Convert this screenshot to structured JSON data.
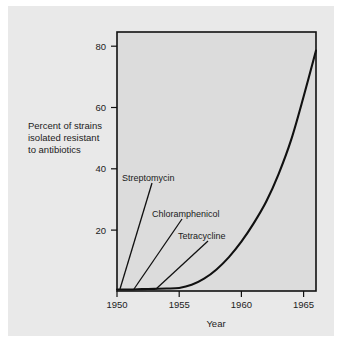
{
  "chart_data": {
    "type": "line",
    "title": "",
    "subtitle": "",
    "xlabel": "Year",
    "ylabel": "Percent of strains isolated resistant to antibiotics",
    "ylabel_lines": [
      "Percent of strains",
      "isolated resistant",
      "to antibiotics"
    ],
    "xlim": [
      1950,
      1966
    ],
    "ylim": [
      0,
      84
    ],
    "xticks": [
      1950,
      1955,
      1960,
      1965
    ],
    "xtick_labels": [
      "1950",
      "1955",
      "1960",
      "1965"
    ],
    "yticks": [
      20,
      40,
      60,
      80
    ],
    "ytick_labels": [
      "20",
      "40",
      "60",
      "80"
    ],
    "grid": false,
    "legend": "none",
    "series": [
      {
        "name": "Percent of strains isolated resistant to antibiotics",
        "x": [
          1950,
          1951,
          1952,
          1953,
          1954,
          1955,
          1956,
          1957,
          1958,
          1959,
          1960,
          1961,
          1962,
          1963,
          1964,
          1965,
          1966
        ],
        "values": [
          0.5,
          0.5,
          0.6,
          0.7,
          0.8,
          1.0,
          2.0,
          4.0,
          7.0,
          11.0,
          16.0,
          22.0,
          29.0,
          38.0,
          49.0,
          63.0,
          78.0
        ]
      }
    ],
    "annotations": [
      {
        "label": "Streptomycin",
        "text_x": 1951.3,
        "text_y": 33.0
      },
      {
        "label": "Chloramphenicol",
        "text_x": 1954.0,
        "text_y": 23.5
      },
      {
        "label": "Tetracycline",
        "text_x": 1956.5,
        "text_y": 16.0
      }
    ],
    "colors": {
      "figure_background": "#ffffff",
      "panel_background": "#e9e9e9",
      "plot_background": "#dcdcdc",
      "axis": "#111111",
      "curve": "#111111",
      "text": "#222222"
    }
  }
}
